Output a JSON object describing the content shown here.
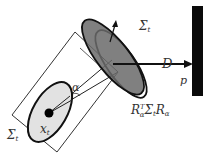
{
  "diagram": {
    "labels": {
      "sigma_top": "Σ",
      "sigma_top_sub": "t",
      "sigma_left": "Σ",
      "sigma_left_sub": "t",
      "x": "x",
      "x_sub": "t",
      "alpha": "α",
      "D": "D",
      "p": "p",
      "rot_R": "R",
      "rot_T": "T",
      "rot_a": "α",
      "rot_sigma": "Σ",
      "rot_t": "t",
      "rot_R2": "R",
      "rot_a2": "α"
    },
    "colors": {
      "stroke": "#111111",
      "light_fill": "#e2e2e2",
      "dark_fill": "#6a6a6a",
      "wall": "#0a0a0a"
    }
  }
}
